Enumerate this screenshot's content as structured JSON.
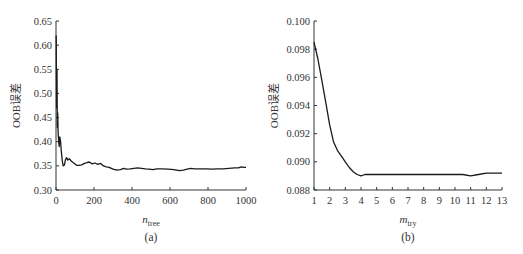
{
  "chart_data": [
    {
      "type": "line",
      "caption": "(a)",
      "title": "",
      "xlabel": "n",
      "xlabel_sub": "tree",
      "ylabel": "OOB误差",
      "xlim": [
        0,
        1000
      ],
      "ylim": [
        0.3,
        0.65
      ],
      "xticks": [
        0,
        200,
        400,
        600,
        800,
        1000
      ],
      "xtick_labels": [
        "0",
        "200",
        "400",
        "600",
        "800",
        "1000"
      ],
      "yticks": [
        0.3,
        0.35,
        0.4,
        0.45,
        0.5,
        0.55,
        0.6,
        0.65
      ],
      "ytick_labels": [
        "0.30",
        "0.35",
        "0.40",
        "0.45",
        "0.50",
        "0.55",
        "0.60",
        "0.65"
      ],
      "grid": false,
      "series": [
        {
          "name": "OOB error vs ntree",
          "x": [
            1,
            3,
            5,
            7,
            9,
            11,
            14,
            17,
            20,
            24,
            28,
            33,
            38,
            44,
            50,
            56,
            62,
            70,
            80,
            90,
            100,
            110,
            120,
            135,
            150,
            165,
            175,
            190,
            205,
            220,
            235,
            250,
            265,
            280,
            300,
            320,
            340,
            355,
            370,
            390,
            410,
            430,
            450,
            470,
            490,
            510,
            530,
            560,
            590,
            620,
            650,
            670,
            690,
            710,
            730,
            760,
            790,
            820,
            850,
            880,
            910,
            940,
            960,
            975,
            990,
            1000
          ],
          "y": [
            0.62,
            0.47,
            0.55,
            0.43,
            0.46,
            0.42,
            0.4,
            0.39,
            0.41,
            0.4,
            0.38,
            0.36,
            0.35,
            0.352,
            0.363,
            0.367,
            0.362,
            0.365,
            0.36,
            0.357,
            0.354,
            0.351,
            0.351,
            0.352,
            0.355,
            0.357,
            0.358,
            0.354,
            0.356,
            0.353,
            0.355,
            0.35,
            0.348,
            0.347,
            0.343,
            0.341,
            0.342,
            0.345,
            0.343,
            0.344,
            0.345,
            0.346,
            0.345,
            0.344,
            0.343,
            0.342,
            0.344,
            0.344,
            0.343,
            0.342,
            0.34,
            0.341,
            0.343,
            0.345,
            0.344,
            0.344,
            0.344,
            0.343,
            0.344,
            0.344,
            0.345,
            0.346,
            0.346,
            0.348,
            0.347,
            0.347
          ]
        }
      ]
    },
    {
      "type": "line",
      "caption": "(b)",
      "title": "",
      "xlabel": "m",
      "xlabel_sub": "try",
      "ylabel": "OOB误差",
      "xlim": [
        1,
        13
      ],
      "ylim": [
        0.088,
        0.1
      ],
      "xticks": [
        1,
        2,
        3,
        4,
        5,
        6,
        7,
        8,
        9,
        10,
        11,
        12,
        13
      ],
      "xtick_labels": [
        "1",
        "2",
        "3",
        "4",
        "5",
        "6",
        "7",
        "8",
        "9",
        "10",
        "11",
        "12",
        "13"
      ],
      "yticks": [
        0.088,
        0.09,
        0.092,
        0.094,
        0.096,
        0.098,
        0.1
      ],
      "ytick_labels": [
        "0.088",
        "0.090",
        "0.092",
        "0.094",
        "0.096",
        "0.098",
        "0.100"
      ],
      "grid": false,
      "series": [
        {
          "name": "OOB error vs mtry",
          "x": [
            1,
            1.25,
            1.5,
            1.75,
            2,
            2.25,
            2.5,
            2.75,
            3,
            3.25,
            3.5,
            3.75,
            4,
            4.25,
            4.5,
            5,
            6,
            7,
            8,
            9,
            10,
            10.5,
            11,
            11.5,
            12,
            12.5,
            13
          ],
          "y": [
            0.0985,
            0.0973,
            0.0958,
            0.0942,
            0.0926,
            0.0914,
            0.0908,
            0.0904,
            0.09,
            0.0896,
            0.0893,
            0.0891,
            0.089,
            0.0891,
            0.0891,
            0.0891,
            0.0891,
            0.0891,
            0.0891,
            0.0891,
            0.0891,
            0.0891,
            0.089,
            0.0891,
            0.0892,
            0.0892,
            0.0892
          ]
        }
      ]
    }
  ]
}
